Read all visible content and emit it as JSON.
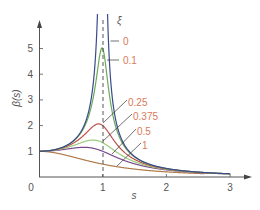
{
  "chart_data": {
    "type": "line",
    "title": "",
    "xlabel": "s",
    "ylabel": "β(s)",
    "xlim": [
      0,
      3.3
    ],
    "ylim": [
      0,
      6
    ],
    "x_ticks": [
      0,
      1,
      2,
      3
    ],
    "y_ticks": [
      1,
      2,
      3,
      4,
      5
    ],
    "grid": false,
    "legend_title": "ξ",
    "annotations": [
      "dashed vertical line at s = 1"
    ],
    "formula": "β(s) = 1 / sqrt((1 - s^2)^2 + (2 ξ s)^2)",
    "series": [
      {
        "name": "0",
        "zeta": 0,
        "color": "#3a4a8c",
        "peak": "∞"
      },
      {
        "name": "0.1",
        "zeta": 0.1,
        "color": "#6aaa5a",
        "peak": 5.0
      },
      {
        "name": "0.25",
        "zeta": 0.25,
        "color": "#c0504a",
        "peak": 2.07
      },
      {
        "name": "0.375",
        "zeta": 0.375,
        "color": "#9ccb7a",
        "peak": 1.44
      },
      {
        "name": "0.5",
        "zeta": 0.5,
        "color": "#7a4a8c",
        "peak": 1.15
      },
      {
        "name": "1",
        "zeta": 1,
        "color": "#b07a4a",
        "peak": 1.0
      }
    ],
    "sample_values": {
      "s": [
        0,
        0.5,
        0.8,
        1.0,
        1.5,
        2.0,
        3.0
      ],
      "zeta_0": [
        1.0,
        1.33,
        2.78,
        null,
        0.8,
        0.33,
        0.125
      ],
      "zeta_0.1": [
        1.0,
        1.32,
        2.6,
        5.0,
        0.78,
        0.33,
        0.125
      ],
      "zeta_0.25": [
        1.0,
        1.28,
        2.07,
        2.0,
        0.74,
        0.32,
        0.124
      ],
      "zeta_0.375": [
        1.0,
        1.22,
        1.6,
        1.33,
        0.69,
        0.31,
        0.122
      ],
      "zeta_0.5": [
        1.0,
        1.15,
        1.27,
        1.0,
        0.63,
        0.3,
        0.118
      ],
      "zeta_1": [
        1.0,
        0.8,
        0.61,
        0.5,
        0.31,
        0.2,
        0.1
      ]
    }
  },
  "axis": {
    "x_label": "s",
    "y_label": "β(s)",
    "x_tick_labels": [
      "0",
      "1",
      "2",
      "3"
    ],
    "y_tick_labels": [
      "1",
      "2",
      "3",
      "4",
      "5"
    ],
    "legend_title": "ξ"
  },
  "colors": {
    "axis": "#555555",
    "label_text": "#d97a5a",
    "tick_text": "#555555",
    "leader": "#333333"
  }
}
